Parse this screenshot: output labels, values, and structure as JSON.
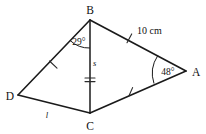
{
  "figure": {
    "kind": "geometry-diagram",
    "shape": "quadrilateral-with-diagonal",
    "background_color": "#ffffff",
    "line_color": "#1a1a1a"
  },
  "vertices": {
    "B": {
      "label": "B",
      "x": 90,
      "y": 20,
      "label_x": 88,
      "label_y": 12
    },
    "A": {
      "label": "A",
      "x": 186,
      "y": 71,
      "label_x": 193,
      "label_y": 75
    },
    "C": {
      "label": "C",
      "x": 90,
      "y": 113,
      "label_x": 87,
      "label_y": 128
    },
    "D": {
      "label": "D",
      "x": 18,
      "y": 95,
      "label_x": 5,
      "label_y": 99
    }
  },
  "angles": {
    "at_B": {
      "value": "29°",
      "label_x": 67,
      "label_y": 43
    },
    "at_A": {
      "value": "48°",
      "label_x": 157,
      "label_y": 75
    }
  },
  "labels": {
    "side_BA": {
      "text": "10 cm",
      "x": 133,
      "y": 34
    },
    "side_BC": {
      "text": "s",
      "x": 93,
      "y": 66
    },
    "side_DC": {
      "text": "l",
      "x": 46,
      "y": 117
    }
  },
  "tick_marks": {
    "on_DB": {
      "count": 1,
      "description": "single tick on segment D-B"
    },
    "on_BA": {
      "count": 1,
      "description": "single tick on segment B-A"
    },
    "on_CA": {
      "count": 1,
      "description": "single tick on segment C-A"
    },
    "on_BC": {
      "count": 2,
      "description": "double tick on diagonal B-C"
    }
  }
}
